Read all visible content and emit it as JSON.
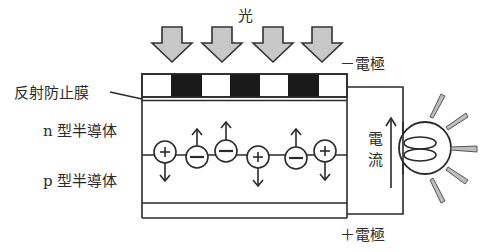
{
  "labels": {
    "light": "光",
    "anti_reflection_film": "反射防止膜",
    "n_type": "n 型半導体",
    "p_type": "p 型半導体",
    "negative_electrode": "－電極",
    "positive_electrode": "＋電極",
    "current_char1": "電",
    "current_char2": "流"
  },
  "light_arrows": {
    "count": 4,
    "centers_x": [
      172,
      222,
      273,
      322
    ],
    "fill": "#c8c8c8"
  },
  "electrode_strip": {
    "segments": [
      "white",
      "black",
      "white",
      "black",
      "white",
      "black",
      "white"
    ]
  },
  "carriers": [
    {
      "sign": "+",
      "cx": 165,
      "cy": 152,
      "motion": "down"
    },
    {
      "sign": "−",
      "cx": 197,
      "cy": 157,
      "motion": "up"
    },
    {
      "sign": "−",
      "cx": 226,
      "cy": 151,
      "motion": "up"
    },
    {
      "sign": "+",
      "cx": 258,
      "cy": 157,
      "motion": "down"
    },
    {
      "sign": "−",
      "cx": 296,
      "cy": 158,
      "motion": "up"
    },
    {
      "sign": "+",
      "cx": 325,
      "cy": 151,
      "motion": "down"
    }
  ],
  "bulb": {
    "state": "lit",
    "rays": 5
  },
  "colors": {
    "line": "#2a2a2a",
    "arrow_fill": "#c8c8c8",
    "electrode_black": "#1a1a1a",
    "ray_fill": "#bdbdbd"
  }
}
